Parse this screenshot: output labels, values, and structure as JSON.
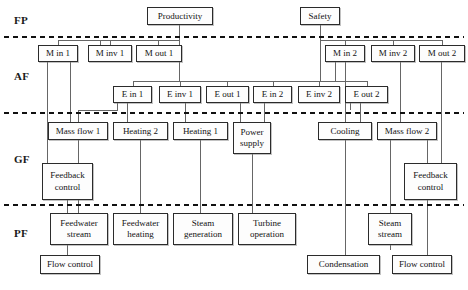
{
  "diagram": {
    "type": "abstraction-hierarchy",
    "levels": [
      {
        "id": "FP",
        "label": "FP",
        "name": "Functional Purpose",
        "y": 20
      },
      {
        "id": "AF",
        "label": "AF",
        "name": "Abstract Function",
        "y": 76
      },
      {
        "id": "GF",
        "label": "GF",
        "name": "Generalised Function",
        "y": 159
      },
      {
        "id": "PF",
        "label": "PF",
        "name": "Physical Function",
        "y": 233
      }
    ],
    "dividers": [
      37,
      113,
      205
    ],
    "colors": {
      "box_border": "#2b2b2b",
      "box_fill": "#fdfdfd",
      "connector": "#555555",
      "divider": "#111111",
      "text": "#121212"
    },
    "nodes": [
      {
        "id": "productivity",
        "label": "Productivity",
        "level": "FP",
        "x": 147,
        "y": 7,
        "w": 66,
        "h": 18
      },
      {
        "id": "safety",
        "label": "Safety",
        "level": "FP",
        "x": 300,
        "y": 7,
        "w": 40,
        "h": 18
      },
      {
        "id": "m-in-1",
        "label": "M in 1",
        "level": "AF",
        "x": 38,
        "y": 45,
        "w": 40,
        "h": 17
      },
      {
        "id": "m-inv-1",
        "label": "M inv 1",
        "level": "AF",
        "x": 88,
        "y": 45,
        "w": 44,
        "h": 17
      },
      {
        "id": "m-out-1",
        "label": "M out 1",
        "level": "AF",
        "x": 136,
        "y": 45,
        "w": 46,
        "h": 17
      },
      {
        "id": "m-in-2",
        "label": "M in 2",
        "level": "AF",
        "x": 325,
        "y": 45,
        "w": 40,
        "h": 17
      },
      {
        "id": "m-inv-2",
        "label": "M inv 2",
        "level": "AF",
        "x": 371,
        "y": 45,
        "w": 44,
        "h": 17
      },
      {
        "id": "m-out-2",
        "label": "M out 2",
        "level": "AF",
        "x": 419,
        "y": 45,
        "w": 46,
        "h": 17
      },
      {
        "id": "e-in-1",
        "label": "E in 1",
        "level": "AF",
        "x": 113,
        "y": 86,
        "w": 39,
        "h": 17
      },
      {
        "id": "e-inv-1",
        "label": "E inv 1",
        "level": "AF",
        "x": 159,
        "y": 86,
        "w": 42,
        "h": 17
      },
      {
        "id": "e-out-1",
        "label": "E out 1",
        "level": "AF",
        "x": 206,
        "y": 86,
        "w": 43,
        "h": 17
      },
      {
        "id": "e-in-2",
        "label": "E in 2",
        "level": "AF",
        "x": 253,
        "y": 86,
        "w": 39,
        "h": 17
      },
      {
        "id": "e-inv-2",
        "label": "E inv 2",
        "level": "AF",
        "x": 298,
        "y": 86,
        "w": 42,
        "h": 17
      },
      {
        "id": "e-out-2",
        "label": "E out 2",
        "level": "AF",
        "x": 345,
        "y": 86,
        "w": 43,
        "h": 17
      },
      {
        "id": "mass-flow-1",
        "label": "Mass flow 1",
        "level": "GF",
        "x": 48,
        "y": 122,
        "w": 60,
        "h": 18
      },
      {
        "id": "heating-2",
        "label": "Heating 2",
        "level": "GF",
        "x": 113,
        "y": 122,
        "w": 55,
        "h": 18
      },
      {
        "id": "heating-1",
        "label": "Heating 1",
        "level": "GF",
        "x": 173,
        "y": 122,
        "w": 55,
        "h": 18
      },
      {
        "id": "power-supply",
        "label": "Power supply",
        "level": "GF",
        "x": 233,
        "y": 122,
        "w": 38,
        "h": 32,
        "two_line": true
      },
      {
        "id": "cooling",
        "label": "Cooling",
        "level": "GF",
        "x": 318,
        "y": 122,
        "w": 54,
        "h": 18
      },
      {
        "id": "mass-flow-2",
        "label": "Mass flow 2",
        "level": "GF",
        "x": 377,
        "y": 122,
        "w": 60,
        "h": 18
      },
      {
        "id": "feedback-control-left",
        "label": "Feedback control",
        "level": "GF",
        "x": 42,
        "y": 163,
        "w": 51,
        "h": 37,
        "two_line": true
      },
      {
        "id": "feedback-control-right",
        "label": "Feedback control",
        "level": "GF",
        "x": 404,
        "y": 163,
        "w": 53,
        "h": 37,
        "two_line": true
      },
      {
        "id": "feedwater-stream",
        "label": "Feedwater stream",
        "level": "PF",
        "x": 50,
        "y": 213,
        "w": 58,
        "h": 32,
        "two_line": true
      },
      {
        "id": "feedwater-heating",
        "label": "Feedwater heating",
        "level": "PF",
        "x": 113,
        "y": 213,
        "w": 55,
        "h": 32,
        "two_line": true
      },
      {
        "id": "steam-generation",
        "label": "Steam generation",
        "level": "PF",
        "x": 173,
        "y": 213,
        "w": 60,
        "h": 32,
        "two_line": true
      },
      {
        "id": "turbine-operation",
        "label": "Turbine operation",
        "level": "PF",
        "x": 238,
        "y": 213,
        "w": 58,
        "h": 32,
        "two_line": true
      },
      {
        "id": "steam-stream",
        "label": "Steam stream",
        "level": "PF",
        "x": 368,
        "y": 213,
        "w": 44,
        "h": 32,
        "two_line": true
      },
      {
        "id": "flow-control-left",
        "label": "Flow control",
        "level": "PF",
        "x": 40,
        "y": 255,
        "w": 60,
        "h": 19
      },
      {
        "id": "condensation",
        "label": "Condensation",
        "level": "PF",
        "x": 307,
        "y": 255,
        "w": 73,
        "h": 19
      },
      {
        "id": "flow-control-right",
        "label": "Flow control",
        "level": "PF",
        "x": 392,
        "y": 255,
        "w": 60,
        "h": 19
      }
    ]
  }
}
